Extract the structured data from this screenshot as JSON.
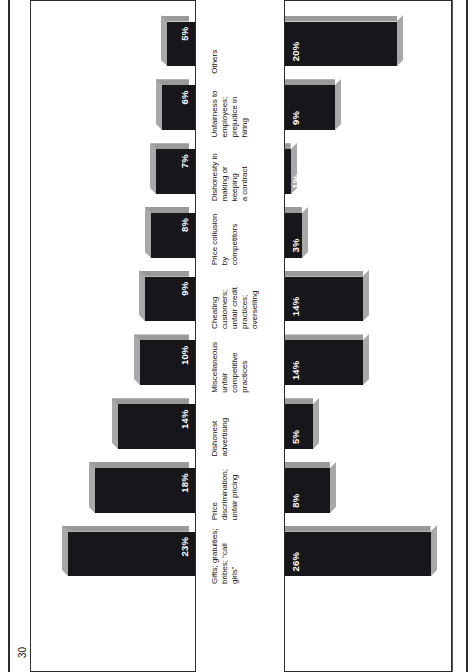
{
  "figure": {
    "orientation": "rotated-90-ccw",
    "background": "#ffffff",
    "bar_front_color": "#17161a",
    "bar_side_color": "#9a9a9a",
    "value_label_color": "#ffffff",
    "rule_color": "#2b2b2b"
  },
  "left_axis": {
    "title": "1961 percentage",
    "ticks": [
      "0%",
      "15",
      "30"
    ]
  },
  "right_axis": {
    "title": "1976 percentage",
    "ticks": [
      "0%",
      "15",
      "30"
    ]
  },
  "categories": [
    "Gifts; gratuities;\nbribes; “call girls”",
    "Price discrimination;\nunfair pricing",
    "Dishonest\nadvertising",
    "Miscellaneous\nunfair competitive\npractices",
    "Cheating customers;\nunfair credit practices;\noverselling",
    "Price collusion by\ncompetitors",
    "Dishonesty in\nmaking or keeping\na contract",
    "Unfairness to\nemployees;\nprejudice in hiring",
    "Others"
  ],
  "chart_data": {
    "type": "bar",
    "title": "",
    "subtitle": "",
    "xlabel": "",
    "ylabel": "",
    "orientation": "horizontal-paired-back-to-back",
    "grid": false,
    "legend": "axis-titles",
    "axis_ranges": {
      "left": [
        0,
        30
      ],
      "right": [
        0,
        30
      ]
    },
    "axis_tick_values": [
      0,
      15,
      30
    ],
    "categories": [
      "Gifts; gratuities; bribes; “call girls”",
      "Price discrimination; unfair pricing",
      "Dishonest advertising",
      "Miscellaneous unfair competitive practices",
      "Cheating customers; unfair credit practices; overselling",
      "Price collusion by competitors",
      "Dishonesty in making or keeping a contract",
      "Unfairness to employees; prejudice in hiring",
      "Others"
    ],
    "series": [
      {
        "name": "1961 percentage",
        "side": "left",
        "values": [
          23,
          18,
          14,
          10,
          9,
          8,
          7,
          6,
          5
        ],
        "labels": [
          "23%",
          "18%",
          "14%",
          "10%",
          "9%",
          "8%",
          "7%",
          "6%",
          "5%"
        ]
      },
      {
        "name": "1976 percentage",
        "side": "right",
        "values": [
          26,
          8,
          5,
          14,
          14,
          3,
          1,
          9,
          20
        ],
        "labels": [
          "26%",
          "8%",
          "5%",
          "14%",
          "14%",
          "3%",
          "1%",
          "9%",
          "20%"
        ]
      }
    ]
  }
}
